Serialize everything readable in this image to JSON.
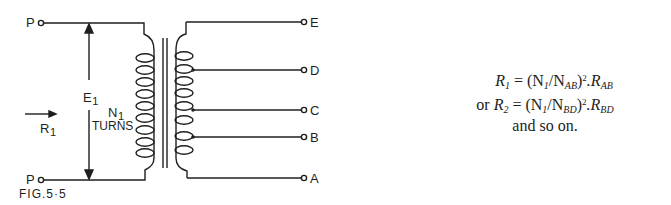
{
  "figure": {
    "caption": "FIG.5·5",
    "primary": {
      "terminal_top": "P",
      "terminal_bottom": "P",
      "voltage_label": "E",
      "voltage_sub": "1",
      "resistance_label": "R",
      "resistance_sub": "1",
      "turns_label": "N",
      "turns_sub": "1",
      "turns_text": "TURNS"
    },
    "secondary_taps": [
      {
        "label": "E",
        "y": 22
      },
      {
        "label": "D",
        "y": 70
      },
      {
        "label": "C",
        "y": 110
      },
      {
        "label": "B",
        "y": 137
      },
      {
        "label": "A",
        "y": 178
      }
    ]
  },
  "equations": {
    "line1": {
      "lhs": "R",
      "lhs_sub": "1",
      "eq": "= (N",
      "n_sub": "1",
      "slash": "/N",
      "den_sub": "AB",
      "pow": "2",
      "tail": ".R",
      "tail_sub": "AB"
    },
    "line2": {
      "prefix": "or ",
      "lhs": "R",
      "lhs_sub": "2",
      "eq": "= (N",
      "n_sub": "1",
      "slash": "/N",
      "den_sub": "BD",
      "pow": "2",
      "tail": ".R",
      "tail_sub": "BD"
    },
    "line3": "and so on."
  }
}
